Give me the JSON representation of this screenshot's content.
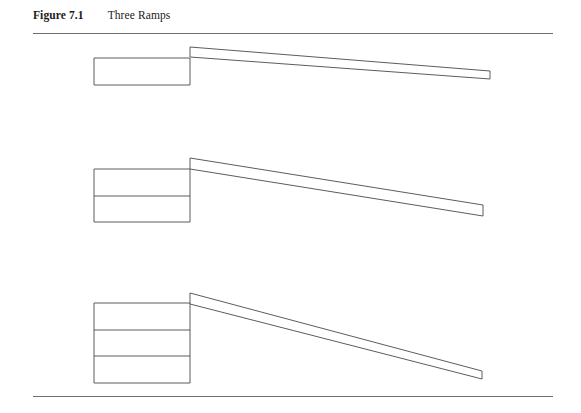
{
  "figure": {
    "label": "Figure 7.1",
    "title": "Three Ramps",
    "rule_color": "#6e6e6e",
    "line_color": "#4a4a4a",
    "fill_color": "#ffffff",
    "background": "#ffffff"
  },
  "diagrams": [
    {
      "id": "ramp-1",
      "name": "one-block-ramp",
      "blocks": 1,
      "block": {
        "x": 94,
        "y": 58,
        "width": 96,
        "height": 27
      },
      "block_dividers": [],
      "ramp": {
        "apex_x": 190,
        "apex_top_y": 47,
        "apex_bottom_y": 57,
        "end_x": 490,
        "end_top_y": 71,
        "end_bottom_y": 79
      }
    },
    {
      "id": "ramp-2",
      "name": "two-block-ramp",
      "blocks": 2,
      "block": {
        "x": 94,
        "y": 169,
        "width": 96,
        "height": 53
      },
      "block_dividers": [
        196
      ],
      "ramp": {
        "apex_x": 190,
        "apex_top_y": 158,
        "apex_bottom_y": 169,
        "end_x": 483,
        "end_top_y": 205,
        "end_bottom_y": 216
      }
    },
    {
      "id": "ramp-3",
      "name": "three-block-ramp",
      "blocks": 3,
      "block": {
        "x": 94,
        "y": 303,
        "width": 96,
        "height": 80
      },
      "block_dividers": [
        330,
        356
      ],
      "ramp": {
        "apex_x": 190,
        "apex_top_y": 293,
        "apex_bottom_y": 304,
        "end_x": 482,
        "end_top_y": 371,
        "end_bottom_y": 379
      }
    }
  ]
}
